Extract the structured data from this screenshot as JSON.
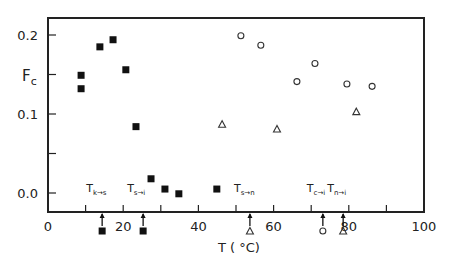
{
  "chart_data": {
    "type": "scatter",
    "title": "",
    "xlabel": "T ( °C)",
    "ylabel": "Fc",
    "xlim": [
      0,
      100
    ],
    "ylim": [
      -0.02,
      0.225
    ],
    "grid": false,
    "legend": null,
    "x_ticks": [
      0,
      20,
      40,
      60,
      80,
      100
    ],
    "x_tick_labels": [
      "0",
      "20",
      "40",
      "60",
      "80",
      "100"
    ],
    "x_minor_ticks": [
      10,
      30,
      50,
      70,
      90
    ],
    "y_ticks": [
      0.0,
      0.1,
      0.2
    ],
    "y_tick_labels": [
      "0.0",
      "0.1",
      "0.2"
    ],
    "y_minor_ticks": [
      0.05,
      0.15
    ],
    "series": [
      {
        "name": "filled squares",
        "marker": "filled-square",
        "x": [
          8.8,
          8.8,
          13.8,
          17.3,
          20.7,
          23.4,
          27.4,
          31.1,
          34.8,
          44.9
        ],
        "y": [
          0.149,
          0.132,
          0.185,
          0.194,
          0.156,
          0.084,
          0.018,
          0.005,
          -0.001,
          0.005
        ]
      },
      {
        "name": "open circles",
        "marker": "open-circle",
        "x": [
          51.3,
          56.6,
          66.2,
          71.0,
          79.5,
          86.2
        ],
        "y": [
          0.199,
          0.187,
          0.141,
          0.164,
          0.138,
          0.135
        ]
      },
      {
        "name": "open triangles",
        "marker": "open-triangle",
        "x": [
          46.3,
          60.9,
          82.0
        ],
        "y": [
          0.087,
          0.081,
          0.103
        ]
      }
    ],
    "annotations": [
      {
        "label": "T",
        "sub": "k→s",
        "x": 14.4,
        "marker": "filled-square"
      },
      {
        "label": "T",
        "sub": "s→i",
        "x": 25.3,
        "marker": "filled-square"
      },
      {
        "label": "T",
        "sub": "s→n",
        "x": 53.7,
        "marker": "open-triangle"
      },
      {
        "label": "T",
        "sub": "c→i",
        "x": 73.1,
        "marker": "open-circle"
      },
      {
        "label": "T",
        "sub": "n→i",
        "x": 78.5,
        "marker": "open-triangle"
      }
    ]
  },
  "labels": {
    "y_axis_main": "F",
    "y_axis_sub": "c",
    "x_axis": "T ( °C)"
  }
}
